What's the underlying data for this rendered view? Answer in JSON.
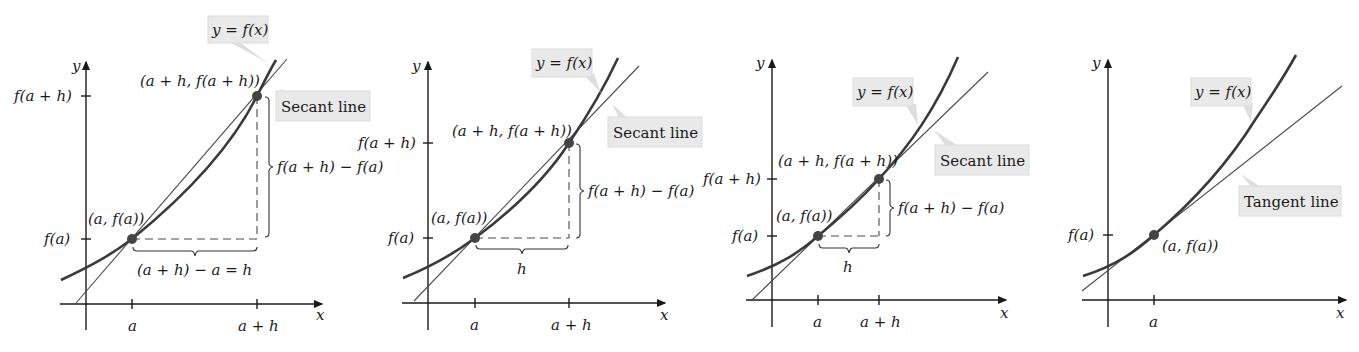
{
  "figure": {
    "panels": [
      {
        "id": "panel-1",
        "y_label": "y",
        "x_label": "x",
        "x_ticks": [
          "a",
          "a + h"
        ],
        "y_ticks": [
          "f(a + h)",
          "f(a)"
        ],
        "point_low": "(a, f(a))",
        "point_high": "(a + h, f(a + h))",
        "rise_label": "f(a + h) − f(a)",
        "run_label": "(a + h) − a = h",
        "curve_callout": "y = f(x)",
        "line_callout": "Secant line"
      },
      {
        "id": "panel-2",
        "y_label": "y",
        "x_label": "x",
        "x_ticks": [
          "a",
          "a + h"
        ],
        "y_ticks": [
          "f(a + h)",
          "f(a)"
        ],
        "point_low": "(a, f(a))",
        "point_high": "(a + h, f(a + h))",
        "rise_label": "f(a + h) − f(a)",
        "run_label": "h",
        "curve_callout": "y = f(x)",
        "line_callout": "Secant line"
      },
      {
        "id": "panel-3",
        "y_label": "y",
        "x_label": "x",
        "x_ticks": [
          "a",
          "a + h"
        ],
        "y_ticks": [
          "f(a + h)",
          "f(a)"
        ],
        "point_low": "(a, f(a))",
        "point_high": "(a + h, f(a + h))",
        "rise_label": "f(a + h) − f(a)",
        "run_label": "h",
        "curve_callout": "y = f(x)",
        "line_callout": "Secant line"
      },
      {
        "id": "panel-4",
        "y_label": "y",
        "x_label": "x",
        "x_ticks": [
          "a"
        ],
        "y_ticks": [
          "f(a)"
        ],
        "point_low": "(a, f(a))",
        "curve_callout": "y = f(x)",
        "line_callout": "Tangent line"
      }
    ]
  },
  "colors": {
    "curve": "#3a3a3a",
    "line": "#4a4a4a",
    "callout_bg": "#e9e9e9",
    "point": "#444444"
  }
}
